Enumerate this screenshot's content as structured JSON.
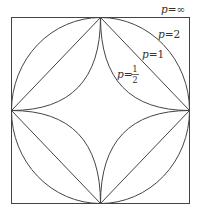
{
  "diagram": {
    "stroke_color": "#444444",
    "background": "#ffffff",
    "curves": [
      {
        "id": "p-inf",
        "p": "∞",
        "shape": "square"
      },
      {
        "id": "p-2",
        "p": "2",
        "shape": "circle"
      },
      {
        "id": "p-1",
        "p": "1",
        "shape": "diamond"
      },
      {
        "id": "p-half",
        "p": "1/2",
        "shape": "astroid-like (concave)"
      }
    ],
    "labels": {
      "p_inf": {
        "var": "p",
        "eq": "=",
        "value": "∞"
      },
      "p_2": {
        "var": "p",
        "eq": "=",
        "value": "2"
      },
      "p_1": {
        "var": "p",
        "eq": "=",
        "value": "1"
      },
      "p_half": {
        "var": "p",
        "eq": "=",
        "numerator": "1",
        "denominator": "2"
      }
    }
  }
}
